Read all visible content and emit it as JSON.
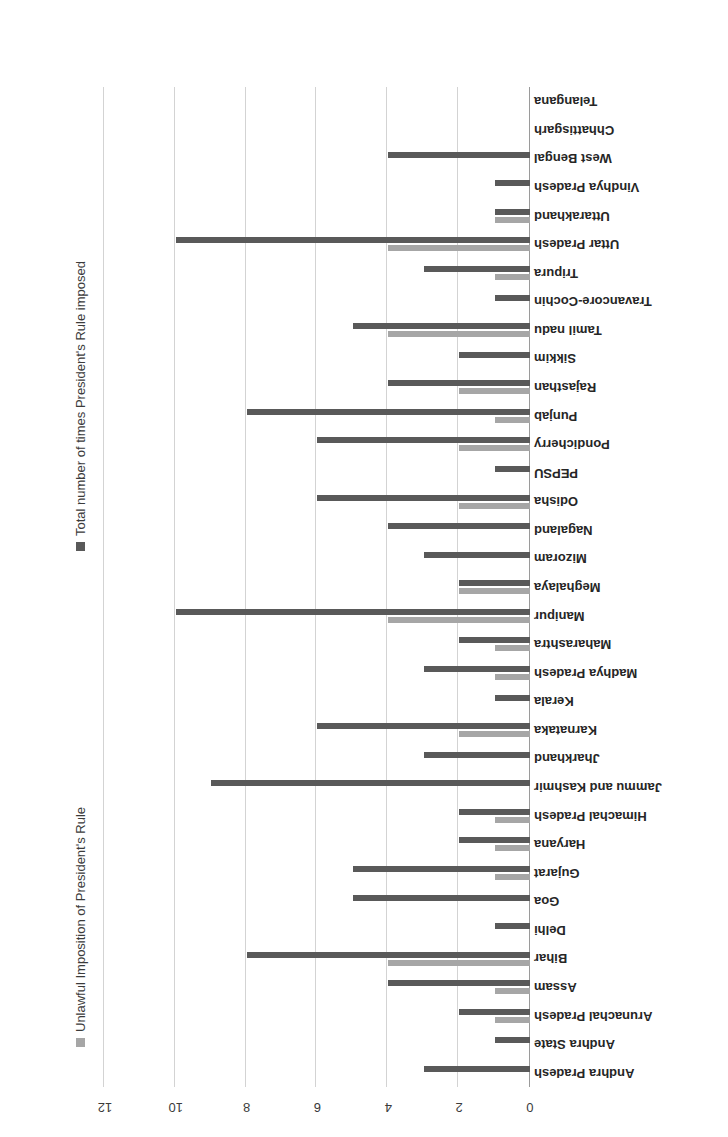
{
  "chart_data": {
    "type": "bar",
    "orientation": "horizontal",
    "title": "",
    "subtitle": "",
    "xlabel": "",
    "ylabel": "",
    "xlim": [
      0,
      12
    ],
    "xticks": [
      "0",
      "2",
      "4",
      "6",
      "8",
      "10",
      "12"
    ],
    "xtick_values": [
      0,
      2,
      4,
      6,
      8,
      10,
      12
    ],
    "grid": true,
    "rotated_180": true,
    "legend_position": "right",
    "colors": {
      "total": "#595959",
      "unlawful": "#a6a6a6",
      "gridline": "#d3d3d3",
      "axis": "#9a9a9a",
      "text": "#262626",
      "background": "#ffffff"
    },
    "legend": [
      {
        "name": "Total number of times President's Rule imposed",
        "color": "#595959"
      },
      {
        "name": "Unlawful Imposition of President's Rule",
        "color": "#a6a6a6"
      }
    ],
    "series": [
      {
        "name": "Total number of times President's Rule imposed",
        "key": "total",
        "color": "#595959",
        "values": [
          3,
          1,
          2,
          4,
          8,
          1,
          5,
          5,
          2,
          2,
          9,
          3,
          6,
          1,
          3,
          2,
          10,
          2,
          3,
          4,
          6,
          1,
          6,
          8,
          4,
          2,
          5,
          1,
          3,
          10,
          1,
          1,
          4,
          0,
          0
        ]
      },
      {
        "name": "Unlawful Imposition of President's Rule",
        "key": "unlawful",
        "color": "#a6a6a6",
        "values": [
          0,
          0,
          1,
          1,
          4,
          0,
          0,
          1,
          1,
          1,
          0,
          0,
          2,
          0,
          1,
          1,
          4,
          2,
          0,
          0,
          2,
          0,
          2,
          1,
          2,
          0,
          4,
          0,
          1,
          4,
          1,
          0,
          0,
          0,
          0
        ]
      }
    ],
    "categories": [
      "Andhra Pradesh",
      "Andhra State",
      "Arunachal Pradesh",
      "Assam",
      "Bihar",
      "Delhi",
      "Goa",
      "Gujarat",
      "Haryana",
      "Himachal Pradesh",
      "Jammu and Kashmir",
      "Jharkhand",
      "Karnataka",
      "Kerala",
      "Madhya Pradesh",
      "Maharashtra",
      "Manipur",
      "Meghalaya",
      "Mizoram",
      "Nagaland",
      "Odisha",
      "PEPSU",
      "Pondicherry",
      "Punjab",
      "Rajasthan",
      "Sikkim",
      "Tamil nadu",
      "Travancore-Cochin",
      "Tripura",
      "Uttar Pradesh",
      "Uttarakhand",
      "Vindhya Pradesh",
      "West Bengal",
      "Chhattisgarh",
      "Telangana"
    ]
  }
}
